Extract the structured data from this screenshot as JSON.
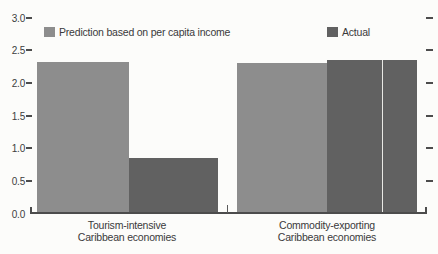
{
  "chart_data": {
    "type": "bar",
    "title": "",
    "categories": [
      "Tourism-intensive Caribbean economies",
      "Commodity-exporting Caribbean economies"
    ],
    "category_lines": [
      [
        "Tourism-intensive",
        "Caribbean economies"
      ],
      [
        "Commodity-exporting",
        "Caribbean economies"
      ]
    ],
    "series": [
      {
        "name": "Prediction based on per capita income",
        "values": [
          2.32,
          2.3
        ],
        "color": "#8d8d8d"
      },
      {
        "name": "Actual",
        "values": [
          0.85,
          2.35
        ],
        "color": "#616161"
      }
    ],
    "ylim": [
      0,
      3.0
    ],
    "ytick_step": 0.5,
    "yticks": [
      "3.0",
      "2.5",
      "2.0",
      "1.5",
      "1.0",
      "0.5",
      "0.0"
    ],
    "grid": false,
    "legend_position": "top",
    "axis_color": "#4c4c4c"
  }
}
